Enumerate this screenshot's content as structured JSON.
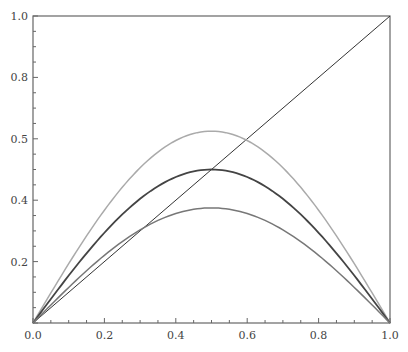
{
  "chart_data": {
    "type": "line",
    "title": "",
    "xlabel": "",
    "ylabel": "",
    "xlim": [
      0,
      1
    ],
    "ylim": [
      0,
      1
    ],
    "grid": false,
    "legend": null,
    "x_ticks": [
      "0.0",
      "0.2",
      "0.4",
      "0.6",
      "0.8",
      "1.0"
    ],
    "y_ticks": [
      {
        "pos": 0.2,
        "label": "0.2"
      },
      {
        "pos": 0.4,
        "label": "0.4"
      },
      {
        "pos": 0.6,
        "label": "0.5"
      },
      {
        "pos": 0.8,
        "label": "0.8"
      },
      {
        "pos": 1.0,
        "label": "1.0"
      }
    ],
    "series": [
      {
        "name": "diagonal",
        "color": "#333333",
        "width": 1,
        "x": [
          0,
          1
        ],
        "y": [
          0,
          1
        ]
      },
      {
        "name": "upper-curve",
        "color": "#aaaaaa",
        "width": 1.5,
        "peak": 0.625,
        "x": [
          0,
          0.1,
          0.2,
          0.3,
          0.4,
          0.5,
          0.6,
          0.7,
          0.8,
          0.9,
          1.0
        ],
        "y": [
          0,
          0.193,
          0.367,
          0.506,
          0.594,
          0.625,
          0.594,
          0.506,
          0.367,
          0.193,
          0
        ]
      },
      {
        "name": "middle-curve",
        "color": "#444444",
        "width": 1.8,
        "peak": 0.5,
        "x": [
          0,
          0.1,
          0.2,
          0.3,
          0.4,
          0.5,
          0.6,
          0.7,
          0.8,
          0.9,
          1.0
        ],
        "y": [
          0,
          0.155,
          0.294,
          0.405,
          0.476,
          0.5,
          0.476,
          0.405,
          0.294,
          0.155,
          0
        ]
      },
      {
        "name": "lower-curve",
        "color": "#777777",
        "width": 1.5,
        "peak": 0.375,
        "x": [
          0,
          0.1,
          0.2,
          0.3,
          0.4,
          0.5,
          0.6,
          0.7,
          0.8,
          0.9,
          1.0
        ],
        "y": [
          0,
          0.116,
          0.22,
          0.303,
          0.357,
          0.375,
          0.357,
          0.303,
          0.22,
          0.116,
          0
        ]
      }
    ]
  }
}
